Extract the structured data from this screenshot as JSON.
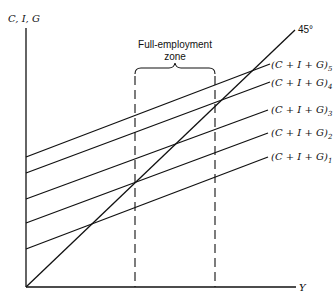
{
  "diagram": {
    "y_axis_label": "C, I, G",
    "x_axis_label": "Y",
    "reference_line": {
      "label": "45°",
      "from": [
        26,
        285
      ],
      "to": [
        295,
        30
      ]
    },
    "zone": {
      "label_line1": "Full-employment",
      "label_line2": "zone",
      "x_left": 135,
      "x_right": 215
    },
    "aggregate_demand_lines": [
      {
        "label": "(C + I + G)",
        "sub": "1",
        "from": [
          26,
          249
        ],
        "to": [
          268,
          157
        ]
      },
      {
        "label": "(C + I + G)",
        "sub": "2",
        "from": [
          26,
          223
        ],
        "to": [
          268,
          133
        ]
      },
      {
        "label": "(C + I + G)",
        "sub": "3",
        "from": [
          26,
          199
        ],
        "to": [
          268,
          110
        ]
      },
      {
        "label": "(C + I + G)",
        "sub": "4",
        "from": [
          26,
          173
        ],
        "to": [
          270,
          82
        ]
      },
      {
        "label": "(C + I + G)",
        "sub": "5",
        "from": [
          26,
          157
        ],
        "to": [
          270,
          64
        ]
      }
    ],
    "color": "#111111"
  }
}
